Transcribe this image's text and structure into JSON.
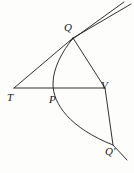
{
  "figure": {
    "kind": "geometric-diagram",
    "background_color": "#fdfdfc",
    "ink_color": "#1a1a1a",
    "width": 134,
    "height": 173,
    "labels": {
      "T": "T",
      "P": "P",
      "V": "V",
      "Q": "Q",
      "Q_prime": "Q′"
    },
    "points": {
      "T": {
        "x": 14,
        "y": 88
      },
      "P": {
        "x": 56,
        "y": 88
      },
      "V": {
        "x": 105,
        "y": 88
      },
      "Q": {
        "x": 73,
        "y": 38
      },
      "Q_prime": {
        "x": 113,
        "y": 145
      }
    },
    "segments": [
      {
        "name": "tangent-line-TQ",
        "from": "T",
        "to": "Q"
      },
      {
        "name": "diameter-line-TV",
        "from": "T",
        "to": "V"
      },
      {
        "name": "chord-QQprime",
        "from": "Q",
        "to": "Q_prime"
      }
    ],
    "curve": {
      "name": "parabola-arc",
      "through": [
        "Q",
        "P",
        "Q_prime"
      ],
      "vertex_side": "left"
    },
    "extensions": {
      "tangent_upper_end": {
        "x": 131,
        "y": 4
      },
      "secondary_line_end": {
        "x": 124,
        "y": 2
      },
      "chord_lower_end": {
        "x": 127,
        "y": 160
      }
    }
  }
}
